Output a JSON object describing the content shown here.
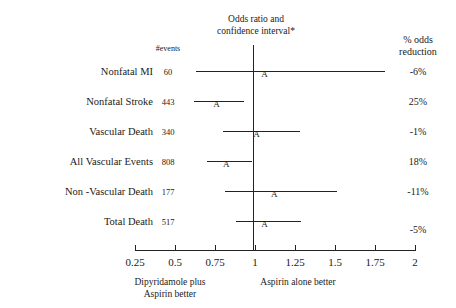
{
  "chart_data": {
    "type": "forest",
    "title": "Odds ratio and confidence interval*",
    "title_line1": "Odds ratio and",
    "title_line2": "confidence interval*",
    "xlabel": "",
    "ylabel": "",
    "xlim": [
      0.25,
      2
    ],
    "x_scale": "linear",
    "grid": false,
    "reference_line": 1,
    "columns": {
      "label": "",
      "events": "#events",
      "reduction_line1": "% odds",
      "reduction_line2": "reduction"
    },
    "xticks": [
      0.25,
      0.5,
      0.75,
      1,
      1.25,
      1.5,
      1.75,
      2
    ],
    "xticklabels": [
      "0.25",
      "0.5",
      "0.75",
      "1",
      "1.25",
      "1.5",
      "1.75",
      "2"
    ],
    "annotations": {
      "left_caption_line1": "Dipyridamole plus",
      "left_caption_line2": "Aspirin better",
      "right_caption_line1": "Aspirin alone better",
      "right_caption_line2": ""
    },
    "marker_glyph": "A",
    "rows": [
      {
        "label": "Nonfatal MI",
        "events": "60",
        "odds_ratio": 1.06,
        "ci_low": 0.63,
        "ci_high": 1.81,
        "reduction": "-6%"
      },
      {
        "label": "Nonfatal Stroke",
        "events": "443",
        "odds_ratio": 0.76,
        "ci_low": 0.62,
        "ci_high": 0.93,
        "reduction": "25%"
      },
      {
        "label": "Vascular Death",
        "events": "340",
        "odds_ratio": 1.01,
        "ci_low": 0.8,
        "ci_high": 1.28,
        "reduction": "-1%"
      },
      {
        "label": "All Vascular Events",
        "events": "808",
        "odds_ratio": 0.82,
        "ci_low": 0.7,
        "ci_high": 0.98,
        "reduction": "18%"
      },
      {
        "label": "Non -Vascular Death",
        "events": "177",
        "odds_ratio": 1.12,
        "ci_low": 0.81,
        "ci_high": 1.51,
        "reduction": "-11%"
      },
      {
        "label": "Total Death",
        "events": "517",
        "odds_ratio": 1.06,
        "ci_low": 0.88,
        "ci_high": 1.29,
        "reduction": "-5%"
      }
    ]
  }
}
